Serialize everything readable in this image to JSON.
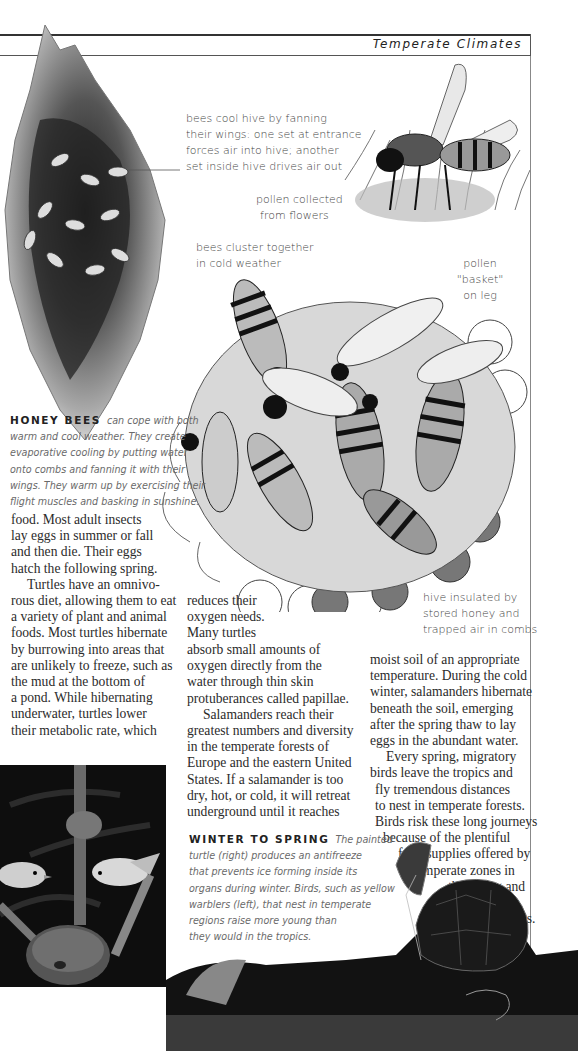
{
  "header": {
    "running_head": "Temperate Climates"
  },
  "labels": {
    "fanning": [
      "bees cool hive by fanning",
      "their wings: one set at entrance",
      "forces air into hive; another",
      "set inside hive drives air out"
    ],
    "pollen_collected": [
      "pollen collected",
      "from flowers"
    ],
    "cluster": [
      "bees cluster together",
      "in cold weather"
    ],
    "pollen_basket": [
      "pollen",
      "\"basket\"",
      "on leg"
    ],
    "insulated": [
      "hive insulated by",
      "stored honey and",
      "trapped air in combs"
    ]
  },
  "captions": {
    "honey_bees": {
      "lead": "HONEY BEES",
      "lines": [
        "can cope with both",
        "warm and cool weather. They create",
        "evaporative cooling by putting water",
        "onto combs and fanning it with their",
        "wings. They warm up by exercising their",
        "flight muscles and basking in sunshine."
      ]
    },
    "winter_to_spring": {
      "lead": "WINTER TO SPRING",
      "lines": [
        "The painted",
        "turtle (right) produces an antifreeze",
        "that prevents ice forming inside its",
        "organs during winter. Birds, such as yellow",
        "warblers (left), that nest in temperate",
        "regions raise more young than",
        "they would in the tropics."
      ]
    }
  },
  "body": {
    "col1": [
      "food. Most adult insects",
      "lay eggs in summer or fall",
      "and then die. Their eggs",
      "hatch the following spring.",
      "Turtles have an omnivo-",
      "rous diet, allowing them to eat",
      "a variety of plant and animal",
      "foods. Most turtles hibernate",
      "by burrowing into areas that",
      "are unlikely to freeze, such as",
      "the mud at the bottom of",
      "a pond. While hibernating",
      "underwater, turtles lower",
      "their metabolic rate, which"
    ],
    "col2a": [
      "reduces their",
      "oxygen needs.",
      "Many turtles"
    ],
    "col2b": [
      "absorb small amounts of",
      "oxygen directly from the",
      "water through thin skin",
      "protuberances called papillae.",
      "Salamanders reach their",
      "greatest numbers and diversity",
      "in the temperate forests of",
      "Europe and the eastern United",
      "States. If a salamander is too",
      "dry, hot, or cold, it will retreat",
      "underground until it reaches"
    ],
    "col3": [
      "moist soil of an appropriate",
      "temperature. During the cold",
      "winter, salamanders hibernate",
      "beneath the soil, emerging",
      "after the spring thaw to lay",
      "eggs in the abundant water.",
      "Every spring, migratory",
      "birds leave the tropics and",
      "fly tremendous distances",
      "to nest in temperate forests.",
      "Birds risk these long journeys",
      "because of the plentiful",
      "food supplies offered by",
      "temperate zones in",
      "the spring and",
      "summer",
      "months."
    ]
  },
  "illustrations": {
    "hive": "bee-hive-illustration",
    "bee_on_flower": "bee-on-flower-illustration",
    "bee_cluster": "bee-cluster-illustration",
    "warblers_photo": "yellow-warblers-nest-photo",
    "turtle_photo": "painted-turtle-photo"
  }
}
